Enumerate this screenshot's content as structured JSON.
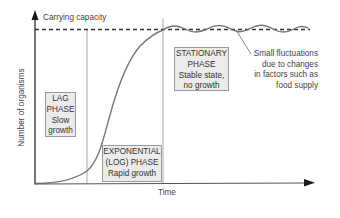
{
  "diagram": {
    "carrying_capacity_label": "Carrying capacity",
    "x_axis_label": "Time",
    "y_axis_label": "Number of organisms",
    "phases": [
      {
        "id": "lag",
        "lines": [
          "LAG",
          "PHASE",
          "Slow",
          "growth"
        ]
      },
      {
        "id": "exponential",
        "lines": [
          "EXPONENTIAL",
          "(LOG) PHASE",
          "Rapid growth"
        ]
      },
      {
        "id": "stationary",
        "lines": [
          "STATIONARY",
          "PHASE",
          "Stable state,",
          "no growth"
        ]
      }
    ],
    "annotation": {
      "lines": [
        "Small fluctuations",
        "due to changes",
        "in factors such as",
        "food supply"
      ]
    },
    "colors": {
      "axis": "#1a1a1a",
      "curve": "#777777",
      "dashed_line": "#333333",
      "phase_box_fill": "#ebebeb",
      "phase_box_border": "#9a9a9a",
      "divider": "#999999"
    }
  }
}
